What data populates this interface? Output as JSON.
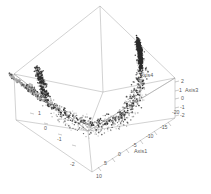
{
  "figure": {
    "kind": "3d-scatter-plot",
    "background": "#ffffff",
    "frame_color": "#9a9a9a",
    "point_color": "#2b2b2b",
    "point_color_light": "#a8a8a8",
    "caption": ""
  },
  "chart_data": {
    "type": "scatter",
    "projection": "3d",
    "title": "",
    "axes": [
      {
        "id": "axis1",
        "label": "Axis1",
        "label_position": "bottom-right",
        "ticks": [
          -20,
          -15,
          -10,
          -5,
          0,
          5,
          10
        ],
        "tick_labels": [
          "-20",
          "-15",
          "-10",
          "-5",
          "0",
          "5",
          "10"
        ],
        "range": [
          -20,
          10
        ]
      },
      {
        "id": "axis3",
        "label": "Axis3",
        "label_position": "right-vertical",
        "ticks": [
          2,
          1,
          0,
          -1,
          -2
        ],
        "tick_labels": [
          "2",
          "1",
          "0",
          "-1",
          "-2"
        ],
        "range": [
          -2,
          2
        ]
      },
      {
        "id": "axis4",
        "label": "Axis4",
        "label_position": "interior-right",
        "ticks": [
          1,
          0,
          -1,
          -2
        ],
        "tick_labels": [
          "1",
          "0",
          "-1",
          "-2"
        ],
        "range": [
          -2,
          1
        ]
      }
    ],
    "legend": null,
    "grid": false
  }
}
